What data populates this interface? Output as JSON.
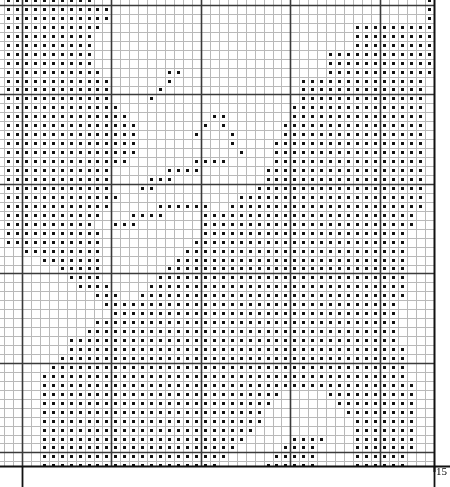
{
  "document": {
    "kind": "cross-stitch-pattern-chart",
    "title": "Cross Stitch Pattern Chart"
  },
  "labels": {
    "bottom_right_count": "15"
  },
  "colors": {
    "background": "#ffffff",
    "minor_grid": "#b9b9b9",
    "major_grid": "#3a3a3a",
    "border": "#111111",
    "symbol": "#111111",
    "text": "#000000"
  },
  "grid": {
    "cell_px": 8.95,
    "origin_x": 4.0,
    "origin_y": -4.0,
    "cols": 48,
    "rows": 53,
    "major_every": 10,
    "major_offset_col": 2,
    "major_offset_row": 1,
    "clip_left": 0,
    "clip_top": 0,
    "clip_right": 434,
    "clip_bottom": 466,
    "symbol": "square-dot"
  },
  "chart_data": {
    "type": "heatmap",
    "xlabel": "",
    "ylabel": "",
    "legend": [],
    "grid": true,
    "symbol_legend": [
      {
        "symbol": "square-dot",
        "label": "stitch"
      }
    ],
    "cols": 48,
    "rows": 53,
    "note": "rows top-to-bottom; each string is one row, '#' = stitched cell, '.' = empty cell",
    "cells": [
      "##########.....................................#",
      "############...................................#",
      "############...................................#",
      "###########............................#########",
      "##########.............................#########",
      "##########.............................#########",
      "##########..........................############",
      "##########..........................############",
      "###########.......##................############",
      "############......#..............##############.",
      "############.....#...............##############.",
      "############....#................##############.",
      "#############...................###############.",
      "##############.........##.......###############.",
      "###############.......#.#......################.",
      "###############......#...#.....################.",
      "###############..........#....#################.",
      "###############...........#...#################.",
      "##############.......####.....#################.",
      "############......####.......##################.",
      "############....###..........##################.",
      "############...##...........###################.",
      "#############.............#####################.",
      "############.....######..######################.",
      "###########...####....########################..",
      "##########..###.......########################..",
      "###########...........#######################...",
      "###########..........########################...",
      "..#########.........#########################...",
      "....#######........##########################...",
      "......#####.......###########################...",
      ".......####......############################...",
      "........####....#############################...",
      "..........###..##############################...",
      "...........#################################....",
      "............################################....",
      "..........##################################....",
      ".........###################################....",
      ".......#####################################....",
      ".......######################################...",
      "......#######################################...",
      ".....########################################...",
      "....#########################################...",
      "....##########################################..",
      "....###########################.....##########..",
      "....##########################.......#########..",
      "....#########################.........########..",
      "....#########################..........#######..",
      "....########################...........#######..",
      "....#######################.....####...#######..",
      "....######################.....####....#######..",
      "....#####################.....#####....######...",
      "....####################.....######....######..."
    ]
  }
}
